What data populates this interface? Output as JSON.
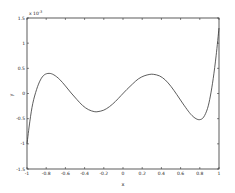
{
  "chart_data": {
    "type": "line",
    "title": "",
    "xlabel": "x",
    "ylabel": "y",
    "y_exponent_label": "x 10",
    "y_exponent_power": "-3",
    "xlim": [
      -1,
      1
    ],
    "ylim": [
      -1.5,
      1.5
    ],
    "grid": false,
    "legend": null,
    "x_ticks": [
      -1,
      -0.8,
      -0.6,
      -0.4,
      -0.2,
      0,
      0.2,
      0.4,
      0.6,
      0.8,
      1
    ],
    "x_tick_labels": [
      "-1",
      "-0.8",
      "-0.6",
      "-0.4",
      "-0.2",
      "0",
      "0.2",
      "0.4",
      "0.6",
      "0.8",
      "1"
    ],
    "y_ticks": [
      -1.5,
      -1,
      -0.5,
      0,
      0.5,
      1,
      1.5
    ],
    "y_tick_labels": [
      "-1.5",
      "-1",
      "-0.5",
      "0",
      "0.5",
      "1",
      "1.5"
    ],
    "series": [
      {
        "name": "y(x)",
        "color": "#333333",
        "x": [
          -1.0,
          -0.97,
          -0.94,
          -0.9,
          -0.86,
          -0.82,
          -0.77,
          -0.72,
          -0.66,
          -0.6,
          -0.54,
          -0.48,
          -0.42,
          -0.36,
          -0.3,
          -0.26,
          -0.2,
          -0.14,
          -0.08,
          -0.02,
          0.04,
          0.1,
          0.16,
          0.22,
          0.28,
          0.32,
          0.38,
          0.44,
          0.5,
          0.56,
          0.62,
          0.68,
          0.72,
          0.76,
          0.8,
          0.84,
          0.88,
          0.91,
          0.94,
          0.97,
          1.0
        ],
        "y": [
          -1.0,
          -0.55,
          -0.2,
          0.08,
          0.27,
          0.37,
          0.4,
          0.37,
          0.28,
          0.15,
          0.01,
          -0.12,
          -0.24,
          -0.32,
          -0.36,
          -0.36,
          -0.33,
          -0.26,
          -0.16,
          -0.04,
          0.08,
          0.19,
          0.29,
          0.35,
          0.38,
          0.38,
          0.35,
          0.27,
          0.14,
          -0.02,
          -0.19,
          -0.35,
          -0.44,
          -0.5,
          -0.52,
          -0.47,
          -0.3,
          -0.05,
          0.3,
          0.75,
          1.3
        ]
      }
    ]
  }
}
